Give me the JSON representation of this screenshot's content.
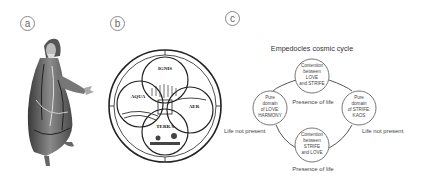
{
  "panels": [
    {
      "id": "a",
      "label": "a",
      "description": "Engraved portrait of Empedocles in robes"
    },
    {
      "id": "b",
      "label": "b",
      "description": "Medieval diagram of the four elements within a circle",
      "elements": [
        {
          "name": "IGNIS",
          "text": "IGNIS",
          "sub": "Aestuans Calida et Sicca"
        },
        {
          "name": "AQUA",
          "text": "AQUA",
          "sub": "Frigida Humida et Obscura"
        },
        {
          "name": "AER",
          "text": "AER",
          "sub": "Humida et Calida"
        },
        {
          "name": "TERRA",
          "text": "TERRA",
          "sub": "Frigida et Sicca"
        }
      ]
    },
    {
      "id": "c",
      "label": "c"
    }
  ],
  "cycle": {
    "title": "Empedocles cosmic cycle",
    "nodes": {
      "top": [
        "Contention",
        "between",
        "LOVE",
        "and STRIFE"
      ],
      "left": [
        "Pure",
        "domain",
        "of LOVE:",
        "HARMONY"
      ],
      "right": [
        "Pure",
        "domain",
        "of STRIFE:",
        "KAOS"
      ],
      "bottom": [
        "Contention",
        "between",
        "STRIFE",
        "and LOVE"
      ]
    },
    "labels": {
      "presence_top": "Presence of life",
      "presence_bottom": "Presence of life",
      "absent_left": "Life not present",
      "absent_right": "Life not present"
    }
  }
}
